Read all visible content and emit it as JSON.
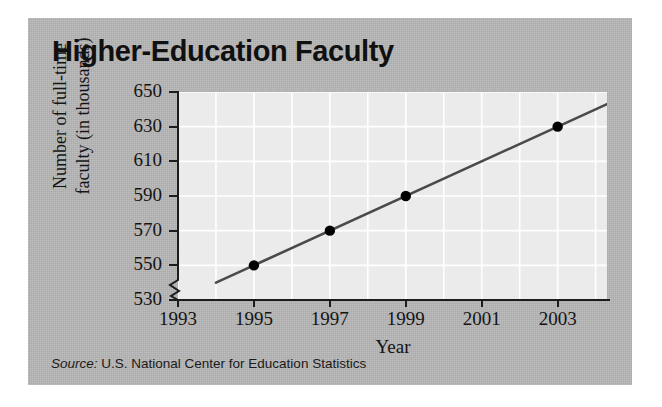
{
  "figure": {
    "title": "Higher-Education Faculty",
    "source_label": "Source:",
    "source_text": " U.S. National Center for Education Statistics",
    "panel_color": "#b6b6b6",
    "plot_background": "#ebebeb",
    "gridline_color": "#ffffff",
    "line_color": "#4a4a4a",
    "marker_color": "#000000"
  },
  "chart_data": {
    "type": "line",
    "title": "Higher-Education Faculty",
    "xlabel": "Year",
    "ylabel": "Number of full-time faculty (in thousands)",
    "ylabel_line1": "Number of full-time",
    "ylabel_line2": "faculty (in thousands)",
    "x": [
      1995,
      1997,
      1999,
      2003
    ],
    "values": [
      550,
      570,
      590,
      630
    ],
    "series": [
      {
        "name": "Full-time faculty",
        "points": [
          {
            "x": 1995,
            "y": 550
          },
          {
            "x": 1997,
            "y": 570
          },
          {
            "x": 1999,
            "y": 590
          },
          {
            "x": 2003,
            "y": 630
          }
        ]
      }
    ],
    "trend_line": {
      "x_start": 1994,
      "y_start": 540,
      "x_end": 2004.3,
      "y_end": 643
    },
    "xlim": [
      1993,
      2004.3
    ],
    "ylim": [
      530,
      650
    ],
    "y_ticks": [
      530,
      550,
      570,
      590,
      610,
      630,
      650
    ],
    "x_ticks": [
      1993,
      1995,
      1997,
      1999,
      2001,
      2003
    ],
    "x_gridlines": [
      1993,
      1994,
      1995,
      1996,
      1997,
      1998,
      1999,
      2000,
      2001,
      2002,
      2003,
      2004
    ],
    "y_axis_break": true,
    "grid": true,
    "legend": "none"
  }
}
